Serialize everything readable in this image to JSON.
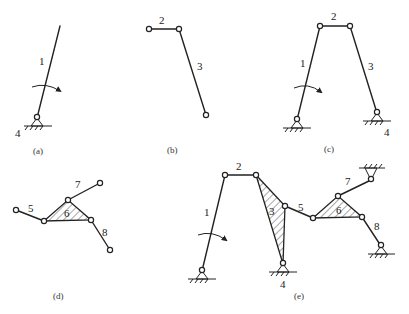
{
  "header_text_partial": "(truncated line of Chinese text at top edge of image)",
  "panels": {
    "a": {
      "caption": "(a)",
      "labels": {
        "link1": "1",
        "ground": "4"
      }
    },
    "b": {
      "caption": "(b)",
      "labels": {
        "link2": "2",
        "link3": "3"
      }
    },
    "c": {
      "caption": "(c)",
      "labels": {
        "link1": "1",
        "link2": "2",
        "link3": "3",
        "ground": "4"
      }
    },
    "d": {
      "caption": "(d)",
      "labels": {
        "link5": "5",
        "link6": "6",
        "link7": "7",
        "link8": "8"
      }
    },
    "e": {
      "caption": "(e)",
      "labels": {
        "link1": "1",
        "link2": "2",
        "link3": "3",
        "ground": "4",
        "link5": "5",
        "link6": "6",
        "link7": "7",
        "link8": "8"
      }
    }
  },
  "colors": {
    "line": "#222222",
    "background": "#ffffff"
  }
}
